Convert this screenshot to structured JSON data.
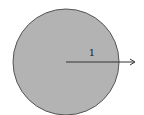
{
  "diagram": {
    "type": "unit-circle",
    "circle": {
      "cx": 66,
      "cy": 62,
      "r": 53,
      "fill": "#b3b3b3",
      "stroke": "#555555"
    },
    "arrow": {
      "x1": 66,
      "y1": 62,
      "x2": 136,
      "y2": 62,
      "color": "#333333"
    },
    "radius_label": "1"
  }
}
